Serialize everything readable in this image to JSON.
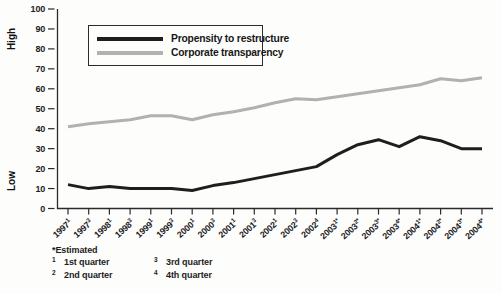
{
  "chart_data": {
    "type": "line",
    "title": "",
    "y_axis_high_label": "High",
    "y_axis_low_label": "Low",
    "ylim": [
      0,
      100
    ],
    "yticks": [
      0,
      10,
      20,
      30,
      40,
      50,
      60,
      70,
      80,
      90,
      100
    ],
    "grid": false,
    "legend_position": "top-left-inside",
    "categories": [
      {
        "year": "1997",
        "q": "1"
      },
      {
        "year": "1997",
        "q": "3"
      },
      {
        "year": "1998",
        "q": "1"
      },
      {
        "year": "1998",
        "q": "3"
      },
      {
        "year": "1999",
        "q": "1"
      },
      {
        "year": "1999",
        "q": "3"
      },
      {
        "year": "2000",
        "q": "1"
      },
      {
        "year": "2000",
        "q": "3"
      },
      {
        "year": "2001",
        "q": "1"
      },
      {
        "year": "2001",
        "q": "3"
      },
      {
        "year": "2002",
        "q": "1"
      },
      {
        "year": "2002",
        "q": "3"
      },
      {
        "year": "2002",
        "q": "4"
      },
      {
        "year": "2003",
        "q": "1*"
      },
      {
        "year": "2003",
        "q": "2*"
      },
      {
        "year": "2003",
        "q": "3*"
      },
      {
        "year": "2003",
        "q": "4*"
      },
      {
        "year": "2004",
        "q": "1*"
      },
      {
        "year": "2004",
        "q": "2*"
      },
      {
        "year": "2004",
        "q": "3*"
      },
      {
        "year": "2004",
        "q": "4*"
      }
    ],
    "series": [
      {
        "name": "Propensity to restructure",
        "color": "#1e1e1e",
        "values": [
          12,
          10,
          11,
          10,
          10,
          10,
          9,
          11.5,
          13,
          15,
          17,
          19,
          21,
          27,
          32,
          34.5,
          31,
          36,
          34,
          30,
          30
        ]
      },
      {
        "name": "Corporate transparency",
        "color": "#b1b1b1",
        "values": [
          41,
          42.5,
          43.5,
          44.5,
          46.5,
          46.5,
          44.5,
          47,
          48.5,
          50.5,
          53,
          55,
          54.5,
          56,
          57.5,
          59,
          60.5,
          62,
          65,
          64,
          65.5
        ]
      }
    ]
  },
  "footnotes": {
    "estimated": "*Estimated",
    "items": [
      {
        "sym": "1",
        "label": "1st quarter"
      },
      {
        "sym": "2",
        "label": "2nd quarter"
      },
      {
        "sym": "3",
        "label": "3rd quarter"
      },
      {
        "sym": "4",
        "label": "4th quarter"
      }
    ]
  }
}
